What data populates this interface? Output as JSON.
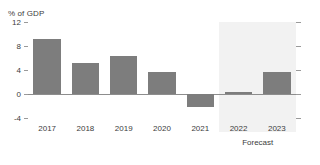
{
  "chart_data": {
    "type": "bar",
    "title": "",
    "unit_label": "% of GDP",
    "xlabel": "",
    "ylabel": "% of GDP",
    "categories": [
      "2017",
      "2018",
      "2019",
      "2020",
      "2021",
      "2022",
      "2023"
    ],
    "values": [
      9.1,
      5.2,
      6.3,
      3.6,
      -2.2,
      0.3,
      3.7
    ],
    "ylim": [
      -4,
      12
    ],
    "yticks": [
      12,
      8,
      4,
      0,
      -4
    ],
    "ytick_labels": [
      "12",
      "8",
      "4",
      "0",
      "-4"
    ],
    "grid": false,
    "legend": null,
    "zero_line": 0,
    "bar_color": "#7d7d7d",
    "annotations": [
      {
        "text": "Forecast",
        "covers": [
          "2022",
          "2023"
        ]
      }
    ],
    "shaded_region": {
      "label": "Forecast",
      "from_category": "2022",
      "to_category": "2023",
      "color": "#f2f2f2"
    }
  },
  "axis": {
    "tick_color": "#9a9a9a",
    "zero_line_color": "#8d8d8d",
    "label_color": "#3c3c3c"
  },
  "footer": {
    "forecast_label": "Forecast"
  }
}
